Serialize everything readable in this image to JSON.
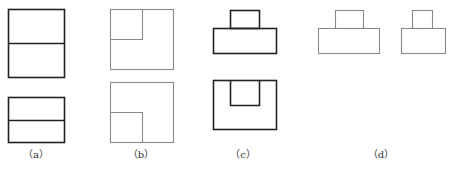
{
  "colors": {
    "dark": "#222222",
    "light": "#8a8a8a"
  },
  "figures": [
    {
      "id": "a",
      "label": "（a）",
      "style": "dark"
    },
    {
      "id": "b",
      "label": "（b）",
      "style": "light"
    },
    {
      "id": "c",
      "label": "（c）",
      "style": "dark"
    },
    {
      "id": "d",
      "label": "（d）",
      "style": "light"
    }
  ]
}
